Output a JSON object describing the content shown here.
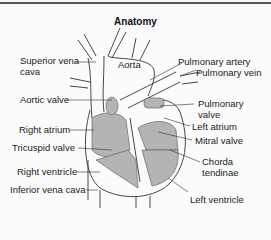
{
  "title": "Anatomy",
  "labels": {
    "superior_vena_cava": [
      "Superior vena",
      "cava"
    ],
    "aorta": "Aorta",
    "pulmonary_artery": "Pulmonary artery",
    "pulmonary_vein": "Pulmonary vein",
    "aortic_valve": "Aortic valve",
    "pulmonary_valve": [
      "Pulmonary",
      "valve"
    ],
    "right_atrium": "Right atrium",
    "left_atrium": "Left atrium",
    "tricuspid_valve": "Tricuspid valve",
    "mitral_valve": "Mitral valve",
    "chorda_tendinae": [
      "Chorda",
      "tendinae"
    ],
    "right_ventricle": "Right ventricle",
    "inferior_vena_cava": "Inferior vena cava",
    "left_ventricle": "Left ventricle"
  }
}
